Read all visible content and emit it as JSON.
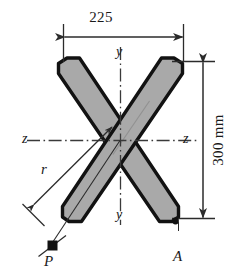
{
  "figure": {
    "colors": {
      "outline": "#121212",
      "fill": "#a9a9a9",
      "dimension_line": "#2b2b2b",
      "centerline": "#3a3a3a",
      "background": "#ffffff",
      "text": "#1a1a1a"
    },
    "dimensions": {
      "width_label": "225",
      "height_label": "300 mm"
    },
    "axes": {
      "y_top_label": "y",
      "y_bottom_label": "y",
      "z_left_label": "z",
      "z_right_label": "z"
    },
    "points": {
      "radius_label": "r",
      "load_point_label": "P",
      "corner_label": "A"
    },
    "icons": {
      "arrow_head": "arrowhead-icon",
      "point_marker": "square-point-marker-icon"
    }
  }
}
